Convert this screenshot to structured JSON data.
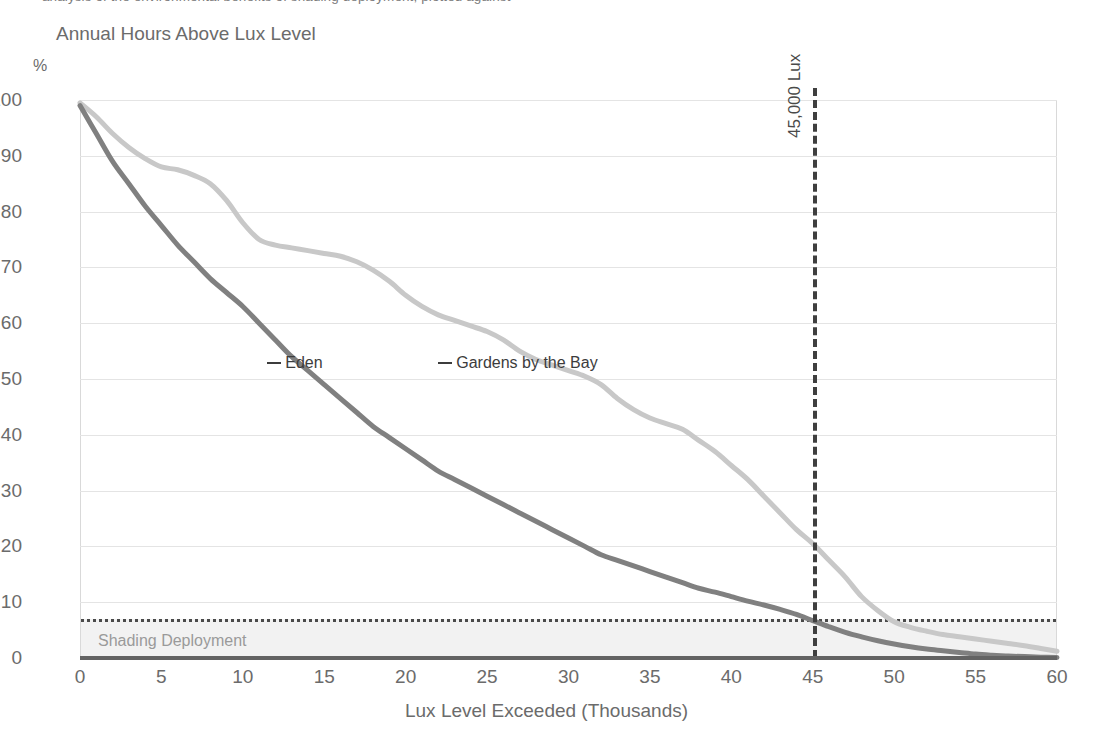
{
  "top_clipped_text": "analysis of the environmental benefits of shading deployment, plotted against",
  "chart_title": "Annual Hours Above Lux Level",
  "y_axis_unit": "%",
  "x_axis_title": "Lux Level Exceeded (Thousands)",
  "threshold": {
    "label": "45,000 Lux",
    "value": 45
  },
  "shading_band": {
    "label": "Shading Deployment",
    "from": 0,
    "to": 7
  },
  "series_callouts": [
    {
      "label": "Eden",
      "x": 11.5,
      "y": 53
    },
    {
      "label": "Gardens by the Bay",
      "x": 22.0,
      "y": 53
    }
  ],
  "colors": {
    "eden": "#808080",
    "gardens": "#c8c8c8",
    "gridline": "#e4e4e4",
    "axis": "#636363",
    "threshold_line": "#3f3f3f",
    "band_fill": "#f2f2f2",
    "band_top_line": "#4a4a4a",
    "text": "#6b6b6b"
  },
  "chart_data": {
    "type": "line",
    "title": "Annual Hours Above Lux Level",
    "subtitle": "",
    "xlabel": "Lux Level Exceeded (Thousands)",
    "ylabel": "%",
    "xlim": [
      0,
      60
    ],
    "ylim": [
      0,
      100
    ],
    "xticks": [
      0,
      5,
      10,
      15,
      20,
      25,
      30,
      35,
      40,
      45,
      50,
      55,
      60
    ],
    "xticklabels": [
      "0",
      "5",
      "10",
      "15",
      "20",
      "25",
      "30",
      "35",
      "40",
      "45",
      "50",
      "55",
      "60"
    ],
    "yticks": [
      0,
      10,
      20,
      30,
      40,
      50,
      60,
      70,
      80,
      90,
      100
    ],
    "yticklabels": [
      "0",
      "10",
      "20",
      "30",
      "40",
      "50",
      "60",
      "70",
      "80",
      "90",
      "100"
    ],
    "grid": "horizontal",
    "legend": "inline-callout",
    "x": [
      0,
      1,
      2,
      3,
      4,
      5,
      6,
      7,
      8,
      9,
      10,
      11,
      12,
      13,
      14,
      15,
      16,
      17,
      18,
      19,
      20,
      21,
      22,
      23,
      24,
      25,
      26,
      27,
      28,
      29,
      30,
      31,
      32,
      33,
      34,
      35,
      36,
      37,
      38,
      39,
      40,
      41,
      42,
      43,
      44,
      45,
      46,
      47,
      48,
      49,
      50,
      51,
      52,
      53,
      54,
      55,
      56,
      57,
      58,
      59,
      60
    ],
    "series": [
      {
        "name": "Eden",
        "color": "#808080",
        "values": [
          99,
          94,
          89,
          85,
          81,
          77.5,
          74,
          71,
          68,
          65.5,
          63,
          60,
          57,
          54,
          51.5,
          49,
          46.5,
          44,
          41.5,
          39.5,
          37.5,
          35.5,
          33.5,
          32,
          30.5,
          29,
          27.5,
          26,
          24.5,
          23,
          21.5,
          20,
          18.5,
          17.5,
          16.5,
          15.5,
          14.5,
          13.5,
          12.5,
          11.8,
          11,
          10.2,
          9.5,
          8.7,
          7.8,
          6.7,
          5.6,
          4.6,
          3.8,
          3.1,
          2.5,
          2,
          1.6,
          1.3,
          1,
          0.7,
          0.5,
          0.35,
          0.25,
          0.15,
          0.1
        ]
      },
      {
        "name": "Gardens by the Bay",
        "color": "#c8c8c8",
        "values": [
          99.5,
          97,
          94,
          91.5,
          89.5,
          88,
          87.5,
          86.5,
          85,
          82,
          78,
          75,
          74,
          73.5,
          73,
          72.5,
          72,
          71,
          69.5,
          67.5,
          65,
          63,
          61.5,
          60.5,
          59.5,
          58.5,
          57,
          55,
          53.5,
          52.5,
          51.5,
          50.5,
          49,
          46.5,
          44.5,
          43,
          42,
          41,
          39,
          37,
          34.5,
          32,
          29,
          26,
          23,
          20.5,
          17.5,
          14.5,
          11,
          8.5,
          6.5,
          5.5,
          4.8,
          4.2,
          3.8,
          3.4,
          3,
          2.6,
          2.2,
          1.7,
          1.2
        ]
      }
    ],
    "annotations": [
      {
        "type": "vline",
        "x": 45,
        "label": "45,000 Lux",
        "style": "dashed"
      },
      {
        "type": "hband",
        "y0": 0,
        "y1": 7,
        "label": "Shading Deployment",
        "style": "filled-with-dotted-top"
      }
    ]
  }
}
